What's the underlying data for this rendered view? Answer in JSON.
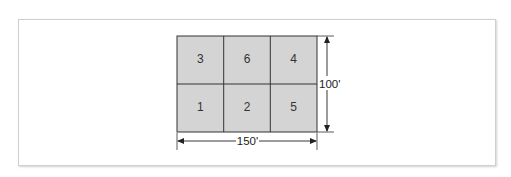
{
  "diagram": {
    "type": "plot-layout-grid",
    "grid": {
      "rows": 2,
      "cols": 3,
      "fill_color": "#d4d4d4",
      "line_color": "#333333",
      "cells": [
        {
          "row": 0,
          "col": 0,
          "label": "3"
        },
        {
          "row": 0,
          "col": 1,
          "label": "6"
        },
        {
          "row": 0,
          "col": 2,
          "label": "4"
        },
        {
          "row": 1,
          "col": 0,
          "label": "1"
        },
        {
          "row": 1,
          "col": 1,
          "label": "2"
        },
        {
          "row": 1,
          "col": 2,
          "label": "5"
        }
      ]
    },
    "dimensions": {
      "width_label": "150'",
      "height_label": "100'"
    },
    "frame": {
      "border_color": "#cfcfcf",
      "background": "#ffffff"
    }
  }
}
